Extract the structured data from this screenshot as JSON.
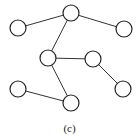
{
  "figure": {
    "caption": "(c)",
    "type": "undirected-graph",
    "node_radius": 8,
    "nodes": [
      {
        "id": "n1",
        "label": "top",
        "x": 71,
        "y": 13
      },
      {
        "id": "n2",
        "label": "left",
        "x": 18,
        "y": 28
      },
      {
        "id": "n3",
        "label": "right",
        "x": 124,
        "y": 29
      },
      {
        "id": "n4",
        "label": "middle",
        "x": 48,
        "y": 58
      },
      {
        "id": "n5",
        "label": "mid-right",
        "x": 93,
        "y": 59
      },
      {
        "id": "n6",
        "label": "lower-left",
        "x": 18,
        "y": 89
      },
      {
        "id": "n7",
        "label": "bottom",
        "x": 71,
        "y": 103
      },
      {
        "id": "n8",
        "label": "lower-right",
        "x": 123,
        "y": 89
      }
    ],
    "edges": [
      [
        "n1",
        "n2"
      ],
      [
        "n1",
        "n3"
      ],
      [
        "n1",
        "n4"
      ],
      [
        "n4",
        "n5"
      ],
      [
        "n5",
        "n8"
      ],
      [
        "n4",
        "n7"
      ],
      [
        "n6",
        "n7"
      ]
    ]
  }
}
